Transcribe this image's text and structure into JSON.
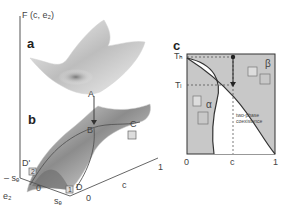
{
  "panel_a": {
    "tag": "a",
    "axis_label": "F (c, e₂)",
    "point_A": "A"
  },
  "panel_b": {
    "tag": "b",
    "points": {
      "B": "B",
      "C": "C",
      "D": "D",
      "D_prime": "D'"
    },
    "box_labels": {
      "box1": "1",
      "box2": "2"
    },
    "axes": {
      "e2_label": "e₂",
      "e2_ticks": [
        "– sₑ",
        "0",
        "sₑ"
      ],
      "c_label": "c",
      "c_ticks": [
        "0",
        "1"
      ]
    }
  },
  "panel_c": {
    "tag": "c",
    "y_ticks": [
      "Tₕ",
      "Tₗ"
    ],
    "x_ticks": [
      "0",
      "c",
      "1"
    ],
    "region_alpha": "α",
    "region_beta": "β",
    "coexistence_line1": "two-phase",
    "coexistence_line2": "coexistence",
    "colors": {
      "phase_fill": "#c8c8c8",
      "border": "#333333",
      "coexistence_fill": "#ffffff"
    }
  }
}
